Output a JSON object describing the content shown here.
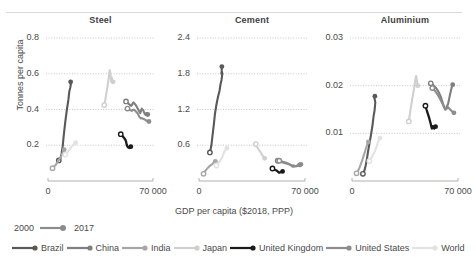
{
  "figure": {
    "header_note": "",
    "xlabel": "GDP per capita ($2018, PPP)",
    "ylabel": "Tonnes per capita"
  },
  "legend": {
    "year_start": "2000",
    "year_end": "2017",
    "series": [
      {
        "name": "Brazil",
        "color": "#595959"
      },
      {
        "name": "China",
        "color": "#7f7f7f"
      },
      {
        "name": "India",
        "color": "#a6a6a6"
      },
      {
        "name": "Japan",
        "color": "#cfcfcf"
      },
      {
        "name": "United Kingdom",
        "color": "#1a1a1a"
      },
      {
        "name": "United States",
        "color": "#8c8c8c"
      },
      {
        "name": "World",
        "color": "#e2e2e2"
      }
    ]
  },
  "chart_data": [
    {
      "type": "line",
      "title": "Steel",
      "xlabel": "GDP per capita ($2018, PPP)",
      "ylabel": "Tonnes per capita",
      "xlim": [
        0,
        70000
      ],
      "ylim": [
        0,
        0.8
      ],
      "xticks": [
        "0",
        "70 000"
      ],
      "yticks": [
        "0.2",
        "0.4",
        "0.6",
        "0.8"
      ],
      "grid": "horizontal-dotted",
      "marker_note": "open circle = 2000, filled circle = 2017",
      "series": [
        {
          "name": "Brazil",
          "x": [
            7200,
            8200,
            9000,
            9800,
            10500,
            11500,
            12600,
            13600,
            14200,
            14900,
            15200,
            15400,
            15100,
            14800,
            14900,
            15100
          ],
          "y": [
            0.115,
            0.125,
            0.15,
            0.195,
            0.255,
            0.33,
            0.4,
            0.455,
            0.5,
            0.525,
            0.54,
            0.545,
            0.555,
            0.56,
            0.545,
            0.555
          ]
        },
        {
          "name": "China",
          "x": [
            52000,
            54000,
            55500,
            57000,
            58500,
            59500,
            60500,
            61500,
            62500,
            63500,
            64000,
            64500,
            65000,
            65500,
            66000,
            66500
          ],
          "y": [
            0.445,
            0.43,
            0.42,
            0.44,
            0.425,
            0.41,
            0.395,
            0.38,
            0.405,
            0.395,
            0.385,
            0.375,
            0.37,
            0.38,
            0.375,
            0.372
          ]
        },
        {
          "name": "India",
          "x": [
            3000,
            3400,
            3900,
            4500,
            5100,
            5800,
            6600,
            7400,
            8000,
            8600,
            9000,
            9400,
            9800,
            10100,
            10400,
            10800
          ],
          "y": [
            0.072,
            0.076,
            0.08,
            0.085,
            0.09,
            0.098,
            0.108,
            0.118,
            0.128,
            0.135,
            0.142,
            0.15,
            0.158,
            0.165,
            0.17,
            0.175
          ]
        },
        {
          "name": "Japan",
          "x": [
            37500,
            38200,
            38900,
            39600,
            40200,
            40800,
            41200,
            41600,
            41900,
            42200,
            42400,
            42600,
            42800,
            43000,
            43200,
            43400
          ],
          "y": [
            0.425,
            0.455,
            0.49,
            0.525,
            0.56,
            0.595,
            0.62,
            0.6,
            0.575,
            0.555,
            0.58,
            0.57,
            0.565,
            0.56,
            0.558,
            0.555
          ]
        },
        {
          "name": "United Kingdom",
          "x": [
            48500,
            49200,
            50000,
            50800,
            51500,
            52000,
            52400,
            52800,
            53100,
            53400,
            53700,
            54000,
            54300,
            54600,
            54900,
            55200
          ],
          "y": [
            0.262,
            0.255,
            0.248,
            0.24,
            0.232,
            0.222,
            0.205,
            0.195,
            0.192,
            0.188,
            0.19,
            0.186,
            0.184,
            0.188,
            0.19,
            0.192
          ]
        },
        {
          "name": "United States",
          "x": [
            53000,
            54500,
            55800,
            57200,
            58500,
            59800,
            60800,
            61800,
            62600,
            63400,
            64200,
            64900,
            65500,
            66100,
            66700,
            67300
          ],
          "y": [
            0.405,
            0.398,
            0.392,
            0.4,
            0.39,
            0.378,
            0.36,
            0.35,
            0.352,
            0.348,
            0.345,
            0.342,
            0.338,
            0.336,
            0.335,
            0.333
          ]
        },
        {
          "name": "World",
          "x": [
            11500,
            12100,
            12700,
            13400,
            14000,
            14700,
            15300,
            15800,
            16200,
            16600,
            16900,
            17200,
            17500,
            17800,
            18100,
            18400
          ],
          "y": [
            0.148,
            0.152,
            0.158,
            0.165,
            0.172,
            0.18,
            0.188,
            0.192,
            0.196,
            0.2,
            0.203,
            0.206,
            0.208,
            0.21,
            0.212,
            0.214
          ]
        }
      ]
    },
    {
      "type": "line",
      "title": "Cement",
      "xlabel": "GDP per capita ($2018, PPP)",
      "ylabel": "Tonnes per capita",
      "xlim": [
        0,
        70000
      ],
      "ylim": [
        0,
        2.4
      ],
      "xticks": [
        "0",
        "70 000"
      ],
      "yticks": [
        "0.6",
        "1.2",
        "1.8",
        "2.4"
      ],
      "grid": "horizontal-dotted",
      "marker_note": "open circle = 2000, filled circle = 2017",
      "series": [
        {
          "name": "Brazil",
          "x": [
            7200,
            8200,
            9000,
            9800,
            10500,
            11500,
            12600,
            13600,
            14200,
            14900,
            15200,
            15400,
            15100,
            14800,
            14900,
            15100
          ],
          "y": [
            0.48,
            0.6,
            0.78,
            0.95,
            1.12,
            1.28,
            1.42,
            1.52,
            1.62,
            1.7,
            1.76,
            1.8,
            1.84,
            1.82,
            1.8,
            1.92
          ]
        },
        {
          "name": "China",
          "x": [
            52000,
            54000,
            55500,
            57000,
            58500,
            59500,
            60500,
            61500,
            62500,
            63500,
            64000,
            64500,
            65000,
            65500,
            66000,
            66500
          ],
          "y": [
            0.34,
            0.32,
            0.31,
            0.3,
            0.29,
            0.28,
            0.27,
            0.26,
            0.26,
            0.25,
            0.25,
            0.25,
            0.26,
            0.26,
            0.26,
            0.27
          ]
        },
        {
          "name": "India",
          "x": [
            3000,
            3400,
            3900,
            4500,
            5100,
            5800,
            6600,
            7400,
            8000,
            8600,
            9000,
            9400,
            9800,
            10100,
            10400,
            10800
          ],
          "y": [
            0.12,
            0.14,
            0.16,
            0.18,
            0.2,
            0.22,
            0.24,
            0.26,
            0.27,
            0.28,
            0.29,
            0.3,
            0.31,
            0.32,
            0.32,
            0.33
          ]
        },
        {
          "name": "Japan",
          "x": [
            37500,
            38200,
            38900,
            39600,
            40200,
            40800,
            41200,
            41600,
            41900,
            42200,
            42400,
            42600,
            42800,
            43000,
            43200,
            43400
          ],
          "y": [
            0.62,
            0.58,
            0.55,
            0.52,
            0.5,
            0.48,
            0.46,
            0.44,
            0.43,
            0.42,
            0.41,
            0.4,
            0.4,
            0.39,
            0.39,
            0.38
          ]
        },
        {
          "name": "United Kingdom",
          "x": [
            48500,
            49200,
            50000,
            50800,
            51500,
            52000,
            52400,
            52800,
            53100,
            53400,
            53700,
            54000,
            54300,
            54600,
            54900,
            55200
          ],
          "y": [
            0.21,
            0.2,
            0.19,
            0.18,
            0.17,
            0.16,
            0.15,
            0.14,
            0.14,
            0.14,
            0.15,
            0.15,
            0.15,
            0.16,
            0.16,
            0.16
          ]
        },
        {
          "name": "United States",
          "x": [
            53000,
            54500,
            55800,
            57200,
            58500,
            59800,
            60800,
            61800,
            62600,
            63400,
            64200,
            64900,
            65500,
            66100,
            66700,
            67300
          ],
          "y": [
            0.34,
            0.33,
            0.32,
            0.31,
            0.3,
            0.28,
            0.26,
            0.24,
            0.24,
            0.25,
            0.25,
            0.26,
            0.26,
            0.27,
            0.27,
            0.28
          ]
        },
        {
          "name": "World",
          "x": [
            11500,
            12100,
            12700,
            13400,
            14000,
            14700,
            15300,
            15800,
            16200,
            16600,
            16900,
            17200,
            17500,
            17800,
            18100,
            18400
          ],
          "y": [
            0.26,
            0.28,
            0.3,
            0.32,
            0.34,
            0.37,
            0.4,
            0.43,
            0.46,
            0.48,
            0.5,
            0.51,
            0.52,
            0.53,
            0.54,
            0.55
          ]
        }
      ]
    },
    {
      "type": "line",
      "title": "Aluminium",
      "xlabel": "GDP per capita ($2018, PPP)",
      "ylabel": "Tonnes per capita",
      "xlim": [
        0,
        70000
      ],
      "ylim": [
        0,
        0.03
      ],
      "xticks": [
        "0",
        "70 000"
      ],
      "yticks": [
        "0.01",
        "0.02",
        "0.03"
      ],
      "grid": "horizontal-dotted",
      "marker_note": "open circle = 2000, filled circle = 2017",
      "series": [
        {
          "name": "Brazil",
          "x": [
            7200,
            8200,
            9000,
            9800,
            10500,
            11500,
            12600,
            13600,
            14200,
            14900,
            15200,
            15400,
            15100,
            14800,
            14900,
            15100
          ],
          "y": [
            0.0015,
            0.0022,
            0.0032,
            0.0045,
            0.006,
            0.0078,
            0.0098,
            0.0118,
            0.0135,
            0.0148,
            0.0158,
            0.0165,
            0.017,
            0.0174,
            0.0176,
            0.0178
          ]
        },
        {
          "name": "China",
          "x": [
            52000,
            54000,
            55500,
            57000,
            58500,
            59500,
            60500,
            61500,
            62500,
            63500,
            64000,
            64500,
            65000,
            65500,
            66000,
            66500
          ],
          "y": [
            0.0205,
            0.02,
            0.0195,
            0.0188,
            0.0178,
            0.0168,
            0.0158,
            0.015,
            0.0155,
            0.0162,
            0.017,
            0.0178,
            0.0185,
            0.0192,
            0.0198,
            0.0202
          ]
        },
        {
          "name": "India",
          "x": [
            3000,
            3400,
            3900,
            4500,
            5100,
            5800,
            6600,
            7400,
            8000,
            8600,
            9000,
            9400,
            9800,
            10100,
            10400,
            10800
          ],
          "y": [
            0.0016,
            0.0018,
            0.0021,
            0.0025,
            0.0029,
            0.0035,
            0.0042,
            0.005,
            0.0056,
            0.0062,
            0.0066,
            0.007,
            0.0074,
            0.0077,
            0.008,
            0.0082
          ]
        },
        {
          "name": "Japan",
          "x": [
            37500,
            38200,
            38900,
            39600,
            40200,
            40800,
            41200,
            41600,
            41900,
            42200,
            42400,
            42600,
            42800,
            43000,
            43200,
            43400
          ],
          "y": [
            0.0125,
            0.014,
            0.0155,
            0.0168,
            0.018,
            0.019,
            0.02,
            0.0208,
            0.0214,
            0.0218,
            0.022,
            0.0216,
            0.0212,
            0.0208,
            0.0204,
            0.02
          ]
        },
        {
          "name": "United Kingdom",
          "x": [
            48500,
            49200,
            50000,
            50800,
            51500,
            52000,
            52400,
            52800,
            53100,
            53400,
            53700,
            54000,
            54300,
            54600,
            54900,
            55200
          ],
          "y": [
            0.0158,
            0.015,
            0.0142,
            0.0134,
            0.0126,
            0.012,
            0.0114,
            0.011,
            0.0112,
            0.0115,
            0.0113,
            0.0111,
            0.011,
            0.0112,
            0.0113,
            0.0114
          ]
        },
        {
          "name": "United States",
          "x": [
            53000,
            54500,
            55800,
            57200,
            58500,
            59800,
            60800,
            61800,
            62600,
            63400,
            64200,
            64900,
            65500,
            66100,
            66700,
            67300
          ],
          "y": [
            0.0195,
            0.019,
            0.0185,
            0.0178,
            0.017,
            0.0162,
            0.0155,
            0.015,
            0.0152,
            0.0155,
            0.0152,
            0.015,
            0.0148,
            0.0146,
            0.0145,
            0.0143
          ]
        },
        {
          "name": "World",
          "x": [
            11500,
            12100,
            12700,
            13400,
            14000,
            14700,
            15300,
            15800,
            16200,
            16600,
            16900,
            17200,
            17500,
            17800,
            18100,
            18400
          ],
          "y": [
            0.0042,
            0.0045,
            0.0048,
            0.0052,
            0.0056,
            0.006,
            0.0064,
            0.0068,
            0.0072,
            0.0076,
            0.0079,
            0.0082,
            0.0084,
            0.0086,
            0.0088,
            0.009
          ]
        }
      ]
    }
  ]
}
